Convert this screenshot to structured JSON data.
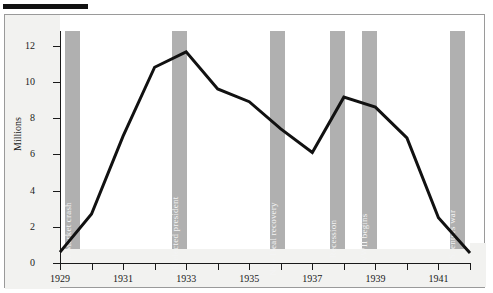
{
  "figure": {
    "rule_present": true
  },
  "chart_data": {
    "type": "line",
    "title": "",
    "subtitle": "",
    "xlabel": "",
    "ylabel": "Millions",
    "xlim": [
      1929,
      1942
    ],
    "ylim": [
      0,
      12.8
    ],
    "grid": false,
    "legend": "none",
    "series": [
      {
        "name": "Unemployment",
        "color": "#111111",
        "x": [
          1929,
          1930,
          1931,
          1932,
          1933,
          1934,
          1935,
          1936,
          1937,
          1938,
          1939,
          1940,
          1941,
          1942
        ],
        "values": [
          0.6,
          2.7,
          7.0,
          10.8,
          11.65,
          9.6,
          8.9,
          7.4,
          6.1,
          9.15,
          8.6,
          6.9,
          2.5,
          0.55
        ]
      }
    ],
    "x_tick_values": [
      1929,
      1930,
      1931,
      1932,
      1933,
      1934,
      1935,
      1936,
      1937,
      1938,
      1939,
      1940,
      1941,
      1942
    ],
    "x_tick_labels": [
      "1929",
      "",
      "1931",
      "",
      "1933",
      "",
      "1935",
      "",
      "1937",
      "",
      "1939",
      "",
      "1941",
      ""
    ],
    "y_ticks": [
      0,
      2,
      4,
      6,
      8,
      10,
      12
    ],
    "y_tick_labels": [
      "0",
      "2",
      "4",
      "6",
      "8",
      "10",
      "12"
    ],
    "band_color": "#b0b0b0",
    "band_text_color": "#f4f4f4",
    "annotations": [
      {
        "label": "Stock Market crash",
        "x": 1929.4
      },
      {
        "label": "FDR elected president",
        "x": 1932.8
      },
      {
        "label": "New Deal recovery",
        "x": 1935.9
      },
      {
        "label": "Recession",
        "x": 1937.8
      },
      {
        "label": "WWII begins",
        "x": 1938.8
      },
      {
        "label": "U.S. enters war",
        "x": 1941.6
      }
    ]
  }
}
